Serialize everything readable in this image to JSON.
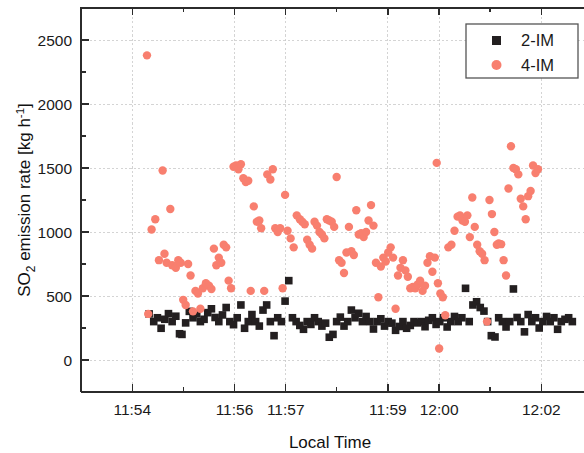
{
  "chart_data": {
    "type": "scatter",
    "title": "",
    "xlabel": "Local Time",
    "ylabel": "SO2 emission rate [kg h-1]",
    "ylabel_parts": {
      "pre": "SO",
      "sub": "2",
      "mid": " emission rate [kg h",
      "sup": "-1",
      "post": "]"
    },
    "grid": true,
    "legend_position": "top-right",
    "xlim": [
      11.8833,
      12.0472
    ],
    "ylim": [
      -250,
      2750
    ],
    "xtick_labels": [
      "11:54",
      "11:56",
      "11:57",
      "11:59",
      "12:00",
      "12:02"
    ],
    "xtick_values": [
      11.9,
      11.9333,
      11.95,
      11.9833,
      12.0,
      12.0333
    ],
    "xminor_count": 1,
    "ytick_labels": [
      "0",
      "500",
      "1000",
      "1500",
      "2000",
      "2500"
    ],
    "ytick_values": [
      0,
      500,
      1000,
      1500,
      2000,
      2500
    ],
    "yminor_count": 1,
    "series": [
      {
        "name": "2-IM",
        "marker": "square",
        "color": "#231f20",
        "points": [
          [
            11.9055,
            360
          ],
          [
            11.907,
            300
          ],
          [
            11.9082,
            330
          ],
          [
            11.9094,
            248
          ],
          [
            11.9106,
            318
          ],
          [
            11.9118,
            362
          ],
          [
            11.913,
            300
          ],
          [
            11.9142,
            342
          ],
          [
            11.9154,
            205
          ],
          [
            11.9162,
            200
          ],
          [
            11.9174,
            290
          ],
          [
            11.9186,
            380
          ],
          [
            11.9198,
            330
          ],
          [
            11.921,
            360
          ],
          [
            11.9222,
            300
          ],
          [
            11.9234,
            318
          ],
          [
            11.9246,
            370
          ],
          [
            11.9258,
            400
          ],
          [
            11.927,
            332
          ],
          [
            11.9282,
            300
          ],
          [
            11.9294,
            352
          ],
          [
            11.9306,
            410
          ],
          [
            11.9318,
            300
          ],
          [
            11.933,
            276
          ],
          [
            11.9342,
            330
          ],
          [
            11.9354,
            430
          ],
          [
            11.9366,
            248
          ],
          [
            11.9378,
            300
          ],
          [
            11.939,
            355
          ],
          [
            11.9402,
            300
          ],
          [
            11.9414,
            265
          ],
          [
            11.9426,
            390
          ],
          [
            11.9438,
            430
          ],
          [
            11.945,
            300
          ],
          [
            11.9462,
            190
          ],
          [
            11.9474,
            330
          ],
          [
            11.9486,
            300
          ],
          [
            11.9498,
            460
          ],
          [
            11.951,
            620
          ],
          [
            11.9522,
            330
          ],
          [
            11.9534,
            300
          ],
          [
            11.9546,
            270
          ],
          [
            11.9558,
            240
          ],
          [
            11.957,
            300
          ],
          [
            11.9582,
            278
          ],
          [
            11.9594,
            330
          ],
          [
            11.9606,
            300
          ],
          [
            11.9618,
            265
          ],
          [
            11.963,
            288
          ],
          [
            11.9642,
            178
          ],
          [
            11.9654,
            200
          ],
          [
            11.9666,
            300
          ],
          [
            11.9678,
            335
          ],
          [
            11.969,
            265
          ],
          [
            11.9702,
            300
          ],
          [
            11.9714,
            390
          ],
          [
            11.9726,
            330
          ],
          [
            11.9738,
            365
          ],
          [
            11.975,
            300
          ],
          [
            11.9762,
            340
          ],
          [
            11.9774,
            300
          ],
          [
            11.9786,
            242
          ],
          [
            11.9798,
            300
          ],
          [
            11.981,
            322
          ],
          [
            11.9822,
            265
          ],
          [
            11.9834,
            300
          ],
          [
            11.9846,
            288
          ],
          [
            11.9858,
            232
          ],
          [
            11.987,
            262
          ],
          [
            11.9882,
            300
          ],
          [
            11.9894,
            248
          ],
          [
            11.9906,
            270
          ],
          [
            11.9918,
            300
          ],
          [
            11.993,
            290
          ],
          [
            11.9942,
            300
          ],
          [
            11.9954,
            260
          ],
          [
            11.9966,
            310
          ],
          [
            11.9978,
            330
          ],
          [
            11.999,
            278
          ],
          [
            12.0002,
            300
          ],
          [
            12.0014,
            330
          ],
          [
            12.0026,
            258
          ],
          [
            12.0038,
            300
          ],
          [
            12.005,
            340
          ],
          [
            12.0062,
            300
          ],
          [
            12.0074,
            330
          ],
          [
            12.0086,
            560
          ],
          [
            12.0098,
            300
          ],
          [
            12.011,
            430
          ],
          [
            12.0122,
            455
          ],
          [
            12.0134,
            410
          ],
          [
            12.0146,
            382
          ],
          [
            12.0158,
            300
          ],
          [
            12.017,
            190
          ],
          [
            12.0182,
            180
          ],
          [
            12.0194,
            330
          ],
          [
            12.0206,
            300
          ],
          [
            12.0218,
            258
          ],
          [
            12.023,
            300
          ],
          [
            12.0242,
            555
          ],
          [
            12.0254,
            332
          ],
          [
            12.0266,
            300
          ],
          [
            12.0278,
            220
          ],
          [
            12.029,
            355
          ],
          [
            12.0302,
            300
          ],
          [
            12.0314,
            330
          ],
          [
            12.0326,
            250
          ],
          [
            12.0338,
            300
          ],
          [
            12.035,
            340
          ],
          [
            12.0362,
            300
          ],
          [
            12.0374,
            330
          ],
          [
            12.0386,
            240
          ],
          [
            12.0398,
            300
          ],
          [
            12.041,
            318
          ],
          [
            12.0422,
            330
          ],
          [
            12.0434,
            300
          ]
        ]
      },
      {
        "name": "4-IM",
        "marker": "circle",
        "color": "#f87f6f",
        "points": [
          [
            11.9048,
            2380
          ],
          [
            11.9052,
            360
          ],
          [
            11.9063,
            1020
          ],
          [
            11.9075,
            1100
          ],
          [
            11.9087,
            780
          ],
          [
            11.9099,
            1480
          ],
          [
            11.9105,
            830
          ],
          [
            11.9112,
            760
          ],
          [
            11.9124,
            1180
          ],
          [
            11.913,
            740
          ],
          [
            11.9142,
            720
          ],
          [
            11.915,
            780
          ],
          [
            11.9158,
            760
          ],
          [
            11.9166,
            470
          ],
          [
            11.9174,
            430
          ],
          [
            11.9182,
            750
          ],
          [
            11.919,
            660
          ],
          [
            11.9198,
            380
          ],
          [
            11.9206,
            540
          ],
          [
            11.9214,
            520
          ],
          [
            11.9222,
            400
          ],
          [
            11.923,
            560
          ],
          [
            11.924,
            600
          ],
          [
            11.925,
            580
          ],
          [
            11.9258,
            555
          ],
          [
            11.9266,
            870
          ],
          [
            11.9274,
            740
          ],
          [
            11.9282,
            800
          ],
          [
            11.929,
            760
          ],
          [
            11.9298,
            900
          ],
          [
            11.9306,
            880
          ],
          [
            11.9314,
            620
          ],
          [
            11.9322,
            560
          ],
          [
            11.933,
            1510
          ],
          [
            11.9338,
            1520
          ],
          [
            11.9346,
            1490
          ],
          [
            11.9354,
            1530
          ],
          [
            11.9362,
            1420
          ],
          [
            11.937,
            1390
          ],
          [
            11.9378,
            1400
          ],
          [
            11.9386,
            540
          ],
          [
            11.9396,
            1200
          ],
          [
            11.9406,
            1080
          ],
          [
            11.9414,
            1090
          ],
          [
            11.942,
            1030
          ],
          [
            11.943,
            540
          ],
          [
            11.944,
            1450
          ],
          [
            11.945,
            1410
          ],
          [
            11.9458,
            1490
          ],
          [
            11.9466,
            1030
          ],
          [
            11.9474,
            1000
          ],
          [
            11.9482,
            1030
          ],
          [
            11.949,
            560
          ],
          [
            11.9498,
            1290
          ],
          [
            11.9506,
            1010
          ],
          [
            11.9516,
            950
          ],
          [
            11.9526,
            880
          ],
          [
            11.9536,
            1130
          ],
          [
            11.9546,
            1100
          ],
          [
            11.9554,
            1080
          ],
          [
            11.9562,
            1060
          ],
          [
            11.957,
            940
          ],
          [
            11.9578,
            900
          ],
          [
            11.9586,
            870
          ],
          [
            11.9594,
            1080
          ],
          [
            11.9602,
            1050
          ],
          [
            11.961,
            1000
          ],
          [
            11.9618,
            980
          ],
          [
            11.9626,
            950
          ],
          [
            11.9634,
            1100
          ],
          [
            11.9642,
            1090
          ],
          [
            11.965,
            1080
          ],
          [
            11.9658,
            1040
          ],
          [
            11.9666,
            1430
          ],
          [
            11.9674,
            780
          ],
          [
            11.9682,
            760
          ],
          [
            11.969,
            680
          ],
          [
            11.9698,
            840
          ],
          [
            11.9706,
            1040
          ],
          [
            11.9714,
            850
          ],
          [
            11.9722,
            820
          ],
          [
            11.973,
            1170
          ],
          [
            11.9738,
            980
          ],
          [
            11.9746,
            990
          ],
          [
            11.9754,
            960
          ],
          [
            11.9762,
            1000
          ],
          [
            11.977,
            1090
          ],
          [
            11.9778,
            1210
          ],
          [
            11.9786,
            1050
          ],
          [
            11.9794,
            760
          ],
          [
            11.9802,
            490
          ],
          [
            11.981,
            730
          ],
          [
            11.9818,
            800
          ],
          [
            11.9826,
            770
          ],
          [
            11.9834,
            840
          ],
          [
            11.9842,
            880
          ],
          [
            11.985,
            800
          ],
          [
            11.9858,
            400
          ],
          [
            11.9866,
            660
          ],
          [
            11.9874,
            720
          ],
          [
            11.9882,
            780
          ],
          [
            11.989,
            700
          ],
          [
            11.9898,
            650
          ],
          [
            11.9906,
            560
          ],
          [
            11.9914,
            570
          ],
          [
            11.9922,
            560
          ],
          [
            11.993,
            590
          ],
          [
            11.9938,
            620
          ],
          [
            11.9946,
            540
          ],
          [
            11.9954,
            580
          ],
          [
            11.9962,
            760
          ],
          [
            11.997,
            810
          ],
          [
            11.9978,
            690
          ],
          [
            11.9986,
            800
          ],
          [
            11.9992,
            1540
          ],
          [
            11.9996,
            600
          ],
          [
            12.0,
            90
          ],
          [
            12.0004,
            520
          ],
          [
            12.0012,
            490
          ],
          [
            12.002,
            350
          ],
          [
            12.003,
            880
          ],
          [
            12.004,
            900
          ],
          [
            12.005,
            1010
          ],
          [
            12.006,
            1120
          ],
          [
            12.0068,
            1130
          ],
          [
            12.0076,
            1090
          ],
          [
            12.0084,
            1080
          ],
          [
            12.0092,
            1130
          ],
          [
            12.01,
            960
          ],
          [
            12.0108,
            1270
          ],
          [
            12.0116,
            1040
          ],
          [
            12.0124,
            900
          ],
          [
            12.0132,
            850
          ],
          [
            12.014,
            830
          ],
          [
            12.0148,
            780
          ],
          [
            12.0156,
            300
          ],
          [
            12.0164,
            1250
          ],
          [
            12.0172,
            1140
          ],
          [
            12.018,
            1000
          ],
          [
            12.0188,
            900
          ],
          [
            12.0194,
            910
          ],
          [
            12.0202,
            905
          ],
          [
            12.021,
            780
          ],
          [
            12.0218,
            660
          ],
          [
            12.0226,
            1340
          ],
          [
            12.0234,
            1670
          ],
          [
            12.0242,
            1500
          ],
          [
            12.025,
            1490
          ],
          [
            12.0258,
            1450
          ],
          [
            12.0266,
            1260
          ],
          [
            12.0274,
            1200
          ],
          [
            12.0282,
            1100
          ],
          [
            12.029,
            1280
          ],
          [
            12.0298,
            1320
          ],
          [
            12.0306,
            1520
          ],
          [
            12.0314,
            1460
          ],
          [
            12.0322,
            1490
          ]
        ]
      }
    ]
  },
  "legend": {
    "entries": [
      {
        "label": "2-IM",
        "marker": "square",
        "color": "#231f20"
      },
      {
        "label": "4-IM",
        "marker": "circle",
        "color": "#f87f6f"
      }
    ]
  },
  "colors": {
    "series_2im": "#231f20",
    "series_4im": "#f87f6f",
    "axis": "#2b2b2b",
    "grid": "#c9c9c9",
    "background": "#ffffff"
  }
}
